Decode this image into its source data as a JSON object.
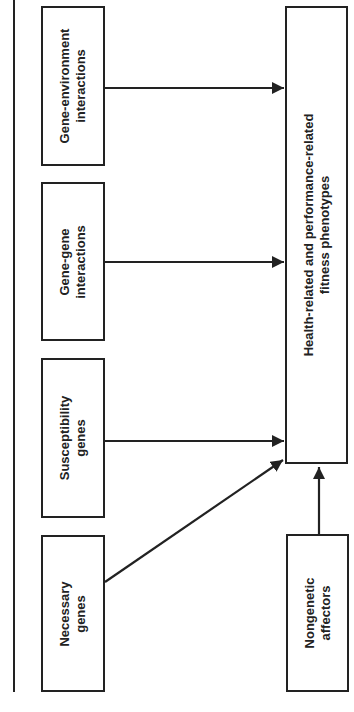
{
  "diagram": {
    "orientation": "rotated-90-ccw",
    "colors": {
      "stroke": "#222222",
      "background": "#ffffff"
    },
    "sources": [
      {
        "id": "gene-environment",
        "lines": [
          "Gene-environment",
          "interactions"
        ]
      },
      {
        "id": "gene-gene",
        "lines": [
          "Gene-gene",
          "interactions"
        ]
      },
      {
        "id": "susceptibility",
        "lines": [
          "Susceptibility",
          "genes"
        ]
      },
      {
        "id": "necessary",
        "lines": [
          "Necessary",
          "genes"
        ]
      }
    ],
    "target": {
      "id": "phenotypes",
      "lines": [
        "Health-related and performance-related",
        "fitness phenotypes"
      ]
    },
    "nongenetic": {
      "id": "nongenetic",
      "lines": [
        "Nongenetic",
        "affectors"
      ]
    },
    "edges": [
      {
        "from": "gene-environment",
        "to": "phenotypes"
      },
      {
        "from": "gene-gene",
        "to": "phenotypes"
      },
      {
        "from": "susceptibility",
        "to": "phenotypes"
      },
      {
        "from": "necessary",
        "to": "phenotypes"
      },
      {
        "from": "nongenetic",
        "to": "phenotypes"
      }
    ]
  }
}
